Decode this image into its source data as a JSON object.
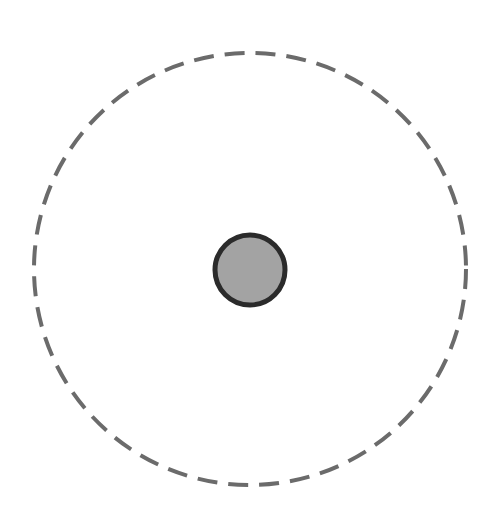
{
  "diagram": {
    "background": "#ffffff",
    "outer_circle": {
      "cx": 250,
      "cy": 269,
      "r": 216,
      "stroke": "#6b6b6b",
      "stroke_width": 4,
      "dasharray": "20 11",
      "fill": "none"
    },
    "inner_circle": {
      "cx": 250,
      "cy": 270,
      "r": 35,
      "fill": "#a3a3a3",
      "stroke": "#2b2b2b",
      "stroke_width": 5
    }
  }
}
